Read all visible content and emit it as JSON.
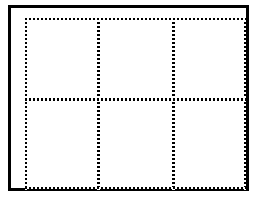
{
  "figure": {
    "width": 257,
    "height": 203,
    "background_color": "#ffffff",
    "ink_color": "#000000"
  },
  "outer_frame": {
    "name": "solid-rectangle-border",
    "style": "solid",
    "color": "#000000",
    "thickness_px": 3,
    "left": 8,
    "top": 5,
    "width": 241,
    "height": 186
  },
  "grid": {
    "columns": 3,
    "rows": 2,
    "line_style": "dotted",
    "line_color": "#000000",
    "dot_size_px": 2,
    "dot_gap_px": 2,
    "vertical_lines": [
      {
        "name": "grid-line-vertical-left",
        "x": 25,
        "top": 18,
        "height": 172,
        "weight": "normal"
      },
      {
        "name": "grid-line-vertical-mid-1",
        "x": 97,
        "top": 18,
        "height": 172,
        "weight": "emphasis"
      },
      {
        "name": "grid-line-vertical-mid-2",
        "x": 172,
        "top": 18,
        "height": 172,
        "weight": "emphasis"
      },
      {
        "name": "grid-line-vertical-right",
        "x": 244,
        "top": 18,
        "height": 172,
        "weight": "normal"
      }
    ],
    "horizontal_lines": [
      {
        "name": "grid-line-horizontal-top",
        "y": 18,
        "left": 25,
        "width": 221,
        "weight": "normal"
      },
      {
        "name": "grid-line-horizontal-middle",
        "y": 98,
        "left": 25,
        "width": 221,
        "weight": "emphasis"
      },
      {
        "name": "grid-line-horizontal-bottom",
        "y": 187,
        "left": 25,
        "width": 221,
        "weight": "normal"
      }
    ],
    "cells": [
      {
        "name": "grid-cell-r1c1",
        "row": 1,
        "col": 1,
        "left": 27,
        "top": 20,
        "width": 70,
        "height": 78
      },
      {
        "name": "grid-cell-r1c2",
        "row": 1,
        "col": 2,
        "left": 100,
        "top": 20,
        "width": 72,
        "height": 78
      },
      {
        "name": "grid-cell-r1c3",
        "row": 1,
        "col": 3,
        "left": 175,
        "top": 20,
        "width": 69,
        "height": 78
      },
      {
        "name": "grid-cell-r2c1",
        "row": 2,
        "col": 1,
        "left": 27,
        "top": 101,
        "width": 70,
        "height": 86
      },
      {
        "name": "grid-cell-r2c2",
        "row": 2,
        "col": 2,
        "left": 100,
        "top": 101,
        "width": 72,
        "height": 86
      },
      {
        "name": "grid-cell-r2c3",
        "row": 2,
        "col": 3,
        "left": 175,
        "top": 101,
        "width": 69,
        "height": 86
      }
    ]
  }
}
